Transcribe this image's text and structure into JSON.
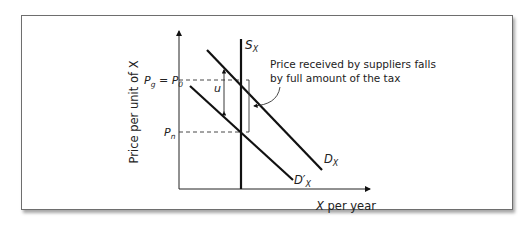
{
  "diagram": {
    "type": "supply-demand-tax-incidence",
    "y_axis_label": "Price per unit of X",
    "x_axis_label_var": "X",
    "x_axis_label_rest": " per year",
    "supply_label": {
      "main": "S",
      "sub": "X"
    },
    "demand_label": {
      "main": "D",
      "sub": "X"
    },
    "demand_shifted_label": {
      "main": "D′",
      "sub": "X"
    },
    "price_top_label": {
      "p1": "P",
      "p1_sub": "g",
      "eq": " = ",
      "p2": "P",
      "p2_sub": "0"
    },
    "price_bottom_label": {
      "p": "P",
      "sub": "n"
    },
    "tax_label": "u",
    "annotation_line1": "Price received by suppliers falls",
    "annotation_line2": "by full amount of the tax",
    "colors": {
      "line": "#111111",
      "dash": "#333333",
      "frame": "#6e6e6e",
      "text": "#222222"
    }
  }
}
